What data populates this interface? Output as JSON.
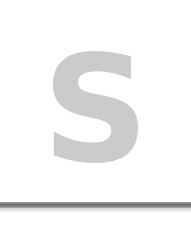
{
  "graphic": {
    "letter": "S",
    "letter_color": "#cbcbcb",
    "bar_color": "#6e6e6e",
    "background": "#ffffff"
  }
}
